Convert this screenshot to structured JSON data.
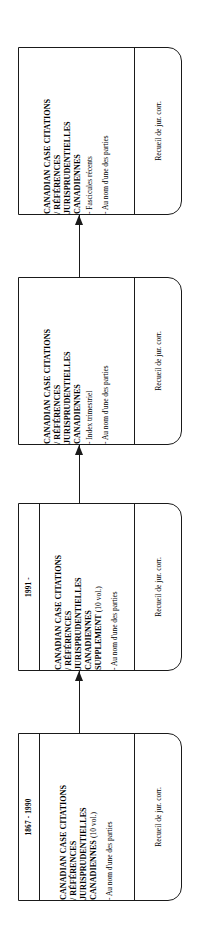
{
  "diagram": {
    "type": "flowchart",
    "orientation": "bottom-to-top",
    "page_size": {
      "width": 197,
      "height": 946
    },
    "nodes": [
      {
        "id": "recent-issues",
        "date": "",
        "title": "CANADIAN CASE CITATIONS\n/ RÉFÉRENCES\nJURISPRUDENTIELLES\nCANADIENNES",
        "title_suffix": "",
        "items": [
          "- Fascicules récents",
          "- Au nom d'une des parties"
        ],
        "footer": "Recueil de jur. corr."
      },
      {
        "id": "quarterly-index",
        "date": "",
        "title": "CANADIAN CASE CITATIONS\n/ RÉFÉRENCES\nJURISPRUDENTIELLES\nCANADIENNES",
        "title_suffix": "",
        "items": [
          "- Index trimestriel",
          "- Au nom d'une des parties"
        ],
        "footer": "Recueil de jur. corr."
      },
      {
        "id": "supplement-1991",
        "date": "1991 -",
        "title": "CANADIAN CASE CITATIONS\n/ RÉFÉRENCES\nJURISPRUDENTIELLES\nCANADIENNES\nSUPPLEMENT ",
        "title_suffix": "(10 vol.)",
        "items": [
          "- Au nom d'une des parties"
        ],
        "footer": "Recueil de jur. corr."
      },
      {
        "id": "base-1867-1990",
        "date": "1867 - 1990",
        "title": "CANADIAN CASE CITATIONS\n/ RÉFÉRENCES\nJURISPRUDENTIELLES\nCANADIENNES ",
        "title_suffix": "(10 vol.)",
        "items": [
          "- Au nom d'une des parties"
        ],
        "footer": "Recueil de jur. corr."
      }
    ],
    "connectors": [
      {
        "from": "quarterly-index",
        "to": "recent-issues"
      },
      {
        "from": "supplement-1991",
        "to": "quarterly-index"
      },
      {
        "from": "base-1867-1990",
        "to": "supplement-1991"
      }
    ],
    "colors": {
      "stroke": "#1a1a1a",
      "background": "#ffffff",
      "text": "#000000"
    }
  }
}
